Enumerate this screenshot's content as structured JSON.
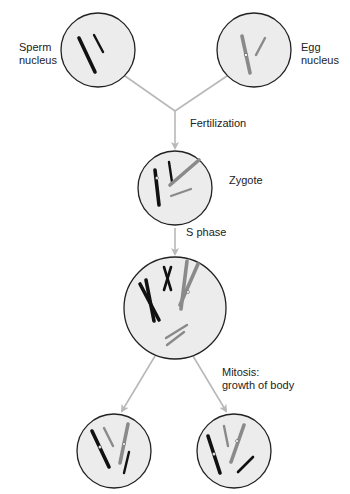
{
  "diagram": {
    "colors": {
      "paternal": "#111111",
      "maternal": "#8a8a8a",
      "cell_fill": "#ececec",
      "cell_stroke": "#222222",
      "arrow": "#b8b8b8"
    },
    "labels": {
      "sperm": [
        "Sperm",
        "nucleus"
      ],
      "egg": [
        "Egg",
        "nucleus"
      ],
      "fertilization": "Fertilization",
      "zygote": "Zygote",
      "s_phase": "S phase",
      "mitosis": [
        "Mitosis:",
        "growth of body"
      ]
    },
    "nodes": [
      {
        "id": "sperm-nucleus",
        "label": "Sperm nucleus",
        "cx": 98,
        "cy": 50,
        "r": 37
      },
      {
        "id": "egg-nucleus",
        "label": "Egg nucleus",
        "cx": 254,
        "cy": 50,
        "r": 37
      },
      {
        "id": "zygote",
        "label": "Zygote",
        "cx": 175,
        "cy": 188,
        "r": 37
      },
      {
        "id": "s-phase-cell",
        "label": "After S phase",
        "cx": 175,
        "cy": 308,
        "r": 51
      },
      {
        "id": "daughter-cell-left",
        "label": "Daughter cell",
        "cx": 114,
        "cy": 451,
        "r": 37
      },
      {
        "id": "daughter-cell-right",
        "label": "Daughter cell",
        "cx": 234,
        "cy": 451,
        "r": 37
      }
    ],
    "edges": [
      {
        "from": "sperm-nucleus",
        "to": "zygote",
        "label": "Fertilization"
      },
      {
        "from": "egg-nucleus",
        "to": "zygote",
        "label": "Fertilization"
      },
      {
        "from": "zygote",
        "to": "s-phase-cell",
        "label": "S phase"
      },
      {
        "from": "s-phase-cell",
        "to": "daughter-cell-left",
        "label": "Mitosis: growth of body"
      },
      {
        "from": "s-phase-cell",
        "to": "daughter-cell-right",
        "label": "Mitosis: growth of body"
      }
    ]
  }
}
